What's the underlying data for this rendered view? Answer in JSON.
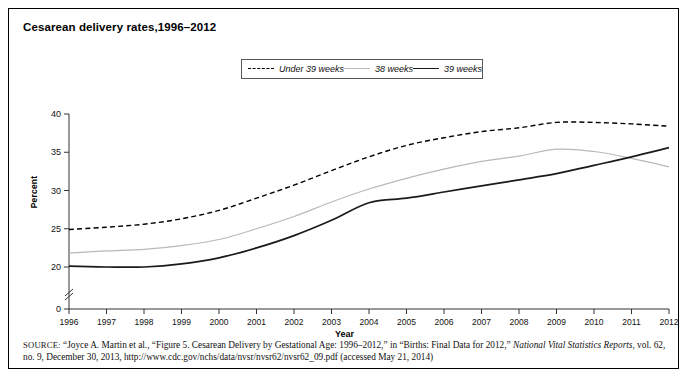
{
  "figure": {
    "title": "Cesarean delivery rates,1996–2012",
    "source_prefix": "SOURCE:",
    "source_text_1": " “Joyce A. Martin et al., “Figure 5. Cesarean Delivery by Gestational Age: 1996–2012,” in “Births: Final Data for 2012,” ",
    "source_italic": "National Vital Statistics Reports",
    "source_text_2": ", vol. 62, no. 9, December 30, 2013, http://www.cdc.gov/nchs/data/nvsr/nvsr62/nvsr62_09.pdf (accessed May 21, 2014)"
  },
  "legend": {
    "position": "top-center",
    "items": [
      {
        "label": "Under 39 weeks",
        "style": "dashed",
        "color": "#000000",
        "icon": "dashed-line-icon"
      },
      {
        "label": "38 weeks",
        "style": "solid",
        "color": "#b9b9b9",
        "icon": "line-icon"
      },
      {
        "label": "39 weeks",
        "style": "solid",
        "color": "#1a1a1a",
        "icon": "line-icon"
      }
    ]
  },
  "chart_data": {
    "type": "line",
    "title": "Cesarean delivery rates,1996–2012",
    "xlabel": "Year",
    "ylabel": "Percent",
    "x": [
      1996,
      1997,
      1998,
      1999,
      2000,
      2001,
      2002,
      2003,
      2004,
      2005,
      2006,
      2007,
      2008,
      2009,
      2010,
      2011,
      2012
    ],
    "xtick_labels": [
      "1996",
      "1997",
      "1998",
      "1999",
      "2000",
      "2001",
      "2002",
      "2003",
      "2004",
      "2005",
      "2006",
      "2007",
      "2008",
      "2009",
      "2010",
      "2011",
      "2012"
    ],
    "ytick_labels": [
      "0",
      "20",
      "25",
      "30",
      "35",
      "40"
    ],
    "yticks": [
      20,
      25,
      30,
      35,
      40
    ],
    "ylim": [
      20,
      40
    ],
    "y_axis_break": true,
    "y_axis_break_value": 0,
    "grid": false,
    "series": [
      {
        "name": "Under 39 weeks",
        "color": "#000000",
        "style": "dashed",
        "values": [
          24.9,
          25.2,
          25.6,
          26.3,
          27.4,
          29.0,
          30.7,
          32.6,
          34.4,
          35.9,
          36.9,
          37.7,
          38.2,
          38.9,
          38.9,
          38.7,
          38.4
        ]
      },
      {
        "name": "38 weeks",
        "color": "#b9b9b9",
        "style": "solid",
        "values": [
          21.8,
          22.1,
          22.3,
          22.8,
          23.6,
          25.0,
          26.6,
          28.5,
          30.2,
          31.6,
          32.8,
          33.8,
          34.5,
          35.4,
          35.1,
          34.2,
          33.1
        ]
      },
      {
        "name": "39 weeks",
        "color": "#1a1a1a",
        "style": "solid",
        "values": [
          20.1,
          20.0,
          20.0,
          20.4,
          21.2,
          22.5,
          24.1,
          26.1,
          28.4,
          29.0,
          29.8,
          30.6,
          31.4,
          32.2,
          33.3,
          34.4,
          35.6
        ]
      }
    ]
  }
}
